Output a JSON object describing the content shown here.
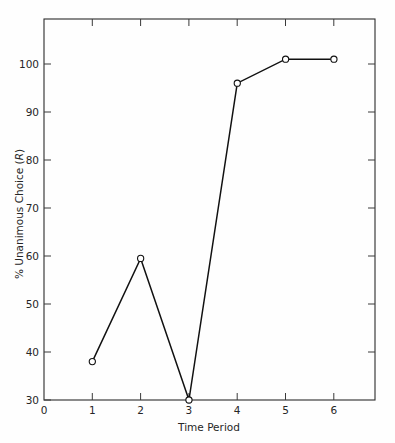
{
  "chart_data": {
    "type": "line",
    "title": "",
    "subtitle": "",
    "xlabel": "Time Period",
    "ylabel_prefix": "% Unanimous Choice (",
    "ylabel_italic": "R",
    "ylabel_suffix": ")",
    "ylabel_full": "% Unanimous Choice (R)",
    "x": [
      1,
      2,
      3,
      4,
      5,
      6
    ],
    "values": [
      38,
      59.5,
      30,
      96,
      101,
      101
    ],
    "series": [
      {
        "name": "% Unanimous Choice (R)",
        "x": [
          1,
          2,
          3,
          4,
          5,
          6
        ],
        "values": [
          38,
          59.5,
          30,
          96,
          101,
          101
        ]
      }
    ],
    "xlim": [
      0,
      6.85
    ],
    "ylim": [
      30,
      104
    ],
    "xticks": [
      0,
      1,
      2,
      3,
      4,
      5,
      6
    ],
    "xtick_labels": [
      "0",
      "1",
      "2",
      "3",
      "4",
      "5",
      "6"
    ],
    "yticks": [
      30,
      40,
      50,
      60,
      70,
      80,
      90,
      100
    ],
    "ytick_labels": [
      "30",
      "40",
      "50",
      "60",
      "70",
      "80",
      "90",
      "100"
    ],
    "grid": false,
    "legend": "none",
    "marker": "open-circle",
    "line_color": "#111111",
    "marker_fill": "#ffffff",
    "marker_edge": "#111111",
    "axis_color": "#2b2b2b",
    "background_color": "#fefefe",
    "frame": "full-box",
    "tick_direction": "in"
  }
}
